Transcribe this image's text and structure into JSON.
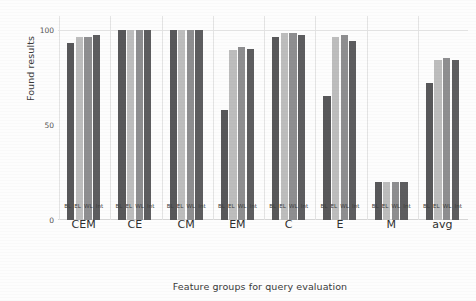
{
  "chart_data": {
    "type": "bar",
    "title": "",
    "xlabel": "Feature groups for query evaluation",
    "ylabel": "Found results",
    "ylim": [
      0,
      105
    ],
    "yticks": [
      0,
      50,
      100
    ],
    "ytick_labels": [
      "0",
      "50",
      "100"
    ],
    "grid": "light vertical separators between groups, faint horizontal gridline at 100",
    "legend": "none (series identified by per-bar tick labels)",
    "categories": [
      "CEM",
      "CE",
      "CM",
      "EM",
      "C",
      "E",
      "M",
      "avg"
    ],
    "bar_tick_labels": [
      "BL",
      "EL",
      "WL",
      "Int"
    ],
    "series": [
      {
        "name": "BL",
        "color": "#58585a",
        "values": [
          93,
          100,
          100,
          58,
          96,
          65,
          20,
          72
        ]
      },
      {
        "name": "EL",
        "color": "#bdbdbd",
        "values": [
          96,
          100,
          100,
          89,
          98,
          96,
          20,
          84
        ]
      },
      {
        "name": "WL",
        "color": "#8e8e90",
        "values": [
          96,
          100,
          100,
          91,
          98,
          97,
          20,
          85
        ]
      },
      {
        "name": "Int",
        "color": "#5d5d5f",
        "values": [
          97,
          100,
          100,
          90,
          97,
          94,
          20,
          84
        ]
      }
    ]
  },
  "axes": {
    "ylabel": "Found results",
    "xlabel": "Feature groups for query evaluation"
  },
  "colors": {
    "bl": "#58585a",
    "el": "#bdbdbd",
    "wl": "#8e8e90",
    "int": "#5d5d5f",
    "grid": "#e4e4e4",
    "text": "#3a3a3a",
    "background": "#fdfdfd"
  }
}
